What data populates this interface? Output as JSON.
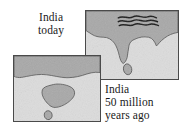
{
  "figure": {
    "background_color": "#ffffff"
  },
  "colors": {
    "land": "#a8a8a8",
    "ocean": "#dcdcdc",
    "outline": "#4a4a4a",
    "mountain": "#1a1a1a",
    "text": "#1a1a1a"
  },
  "panels": [
    {
      "id": "panel-today",
      "name": "map-panel-india-today",
      "caption_lines": [
        "India",
        "today"
      ],
      "features": [
        "asia-landmass",
        "india-peninsula",
        "sri-lanka-island",
        "himalaya-range"
      ]
    },
    {
      "id": "panel-past",
      "name": "map-panel-india-50-million-years-ago",
      "caption_lines": [
        "India",
        "50 million",
        "years ago"
      ],
      "features": [
        "asia-landmass",
        "india-island",
        "sri-lanka-island"
      ]
    }
  ],
  "captions": {
    "today": {
      "line1": "India",
      "line2": "today"
    },
    "past": {
      "line1": "India",
      "line2": "50 million",
      "line3": "years ago"
    }
  }
}
